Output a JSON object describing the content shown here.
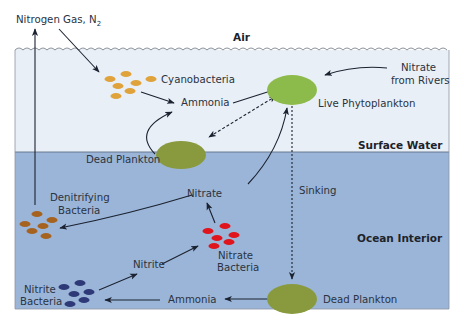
{
  "diagram": {
    "zones": {
      "air": "Air",
      "surface": "Surface Water",
      "interior": "Ocean Interior"
    },
    "labels": {
      "nitrogen_gas": "Nitrogen Gas, N",
      "nitrogen_gas_sub": "2",
      "cyanobacteria": "Cyanobacteria",
      "ammonia_surface": "Ammonia",
      "live_phytoplankton": "Live Phytoplankton",
      "nitrate_rivers_1": "Nitrate",
      "nitrate_rivers_2": "from Rivers",
      "dead_plankton_surface": "Dead Plankton",
      "sinking": "Sinking",
      "nitrate_interior": "Nitrate",
      "denitrifying_1": "Denitrifying",
      "denitrifying_2": "Bacteria",
      "nitrate_bacteria_1": "Nitrate",
      "nitrate_bacteria_2": "Bacteria",
      "nitrite": "Nitrite",
      "nitrite_bacteria_1": "Nitrite",
      "nitrite_bacteria_2": "Bacteria",
      "ammonia_interior": "Ammonia",
      "dead_plankton_interior": "Dead Plankton"
    },
    "colors": {
      "surface_water": "#e9eff6",
      "ocean_interior": "#9bb5d8",
      "phytoplankton": "#8dbb4b",
      "dead_plankton": "#899a3e",
      "cyanobacteria": "#e0a23a",
      "denitrifying": "#a6621f",
      "nitrate_bacteria": "#e0141c",
      "nitrite_bacteria": "#2e3a78"
    }
  }
}
